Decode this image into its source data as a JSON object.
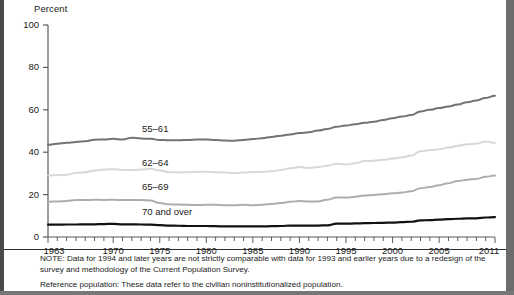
{
  "axis": {
    "y_title": "Percent",
    "y_ticks": [
      0,
      20,
      40,
      60,
      80,
      100
    ],
    "x_ticks_major": [
      1963,
      1970,
      1975,
      1980,
      1985,
      1990,
      1995,
      2000,
      2005,
      2011
    ],
    "x_min": 1963,
    "x_max": 2011
  },
  "series_labels": {
    "s55_61": "55–61",
    "s62_64": "62–64",
    "s65_69": "65–69",
    "s70_over": "70 and over"
  },
  "colors": {
    "s55_61": "#737373",
    "s62_64": "#d8d8d8",
    "s65_69": "#aeaeae",
    "s70_over": "#121212",
    "axis": "#5a5a5a",
    "text": "#1a1a1a"
  },
  "notes": {
    "line1": "NOTE: Data for 1994 and later years are not strictly comparable with data for 1993 and earlier years due to a redesign of the survey and methodology of the Current Population Survey.",
    "line2": "Reference population: These data refer to the civilian noninstitutionalized population."
  },
  "chart_data": {
    "type": "line",
    "title": "",
    "xlabel": "",
    "ylabel": "Percent",
    "xlim": [
      1963,
      2011
    ],
    "ylim": [
      0,
      100
    ],
    "grid": false,
    "legend": "inline-labels",
    "x": [
      1963,
      1964,
      1965,
      1966,
      1967,
      1968,
      1969,
      1970,
      1971,
      1972,
      1973,
      1974,
      1975,
      1976,
      1977,
      1978,
      1979,
      1980,
      1981,
      1982,
      1983,
      1984,
      1985,
      1986,
      1987,
      1988,
      1989,
      1990,
      1991,
      1992,
      1993,
      1994,
      1995,
      1996,
      1997,
      1998,
      1999,
      2000,
      2001,
      2002,
      2003,
      2004,
      2005,
      2006,
      2007,
      2008,
      2009,
      2010,
      2011
    ],
    "series": [
      {
        "name": "55–61",
        "color": "#737373",
        "values": [
          43.5,
          44.0,
          44.4,
          44.8,
          45.2,
          45.9,
          46.0,
          46.3,
          46.0,
          46.8,
          46.5,
          46.3,
          45.8,
          45.6,
          45.6,
          45.8,
          46.0,
          46.0,
          45.8,
          45.5,
          45.4,
          45.8,
          46.2,
          46.6,
          47.2,
          47.8,
          48.4,
          49.0,
          49.4,
          50.2,
          51.0,
          52.0,
          52.6,
          53.2,
          53.9,
          54.4,
          55.2,
          56.0,
          56.8,
          57.5,
          59.2,
          60.0,
          60.8,
          61.6,
          62.5,
          63.6,
          64.4,
          65.6,
          66.6
        ]
      },
      {
        "name": "62–64",
        "color": "#d8d8d8",
        "values": [
          29.0,
          29.2,
          29.4,
          30.2,
          30.6,
          31.4,
          31.8,
          32.0,
          31.6,
          31.6,
          31.8,
          32.2,
          31.4,
          30.6,
          30.5,
          30.6,
          30.8,
          30.8,
          30.6,
          30.4,
          30.2,
          30.4,
          30.6,
          30.8,
          31.0,
          31.6,
          32.4,
          33.0,
          32.6,
          33.0,
          33.6,
          34.6,
          34.2,
          34.8,
          35.8,
          36.0,
          36.4,
          37.0,
          37.6,
          38.4,
          40.4,
          41.0,
          41.4,
          42.2,
          43.0,
          43.8,
          44.0,
          45.0,
          44.4
        ]
      },
      {
        "name": "65–69",
        "color": "#aeaeae",
        "values": [
          16.6,
          16.8,
          17.0,
          17.4,
          17.4,
          17.6,
          17.5,
          17.6,
          17.4,
          17.4,
          17.4,
          17.2,
          16.0,
          15.4,
          15.3,
          15.2,
          15.1,
          15.2,
          15.2,
          15.0,
          15.0,
          15.2,
          15.0,
          15.2,
          15.6,
          16.0,
          16.6,
          17.0,
          16.8,
          16.8,
          17.6,
          18.6,
          18.6,
          19.0,
          19.6,
          19.8,
          20.2,
          20.6,
          21.0,
          21.6,
          23.0,
          23.6,
          24.4,
          25.4,
          26.4,
          27.0,
          27.4,
          28.4,
          29.0
        ]
      },
      {
        "name": "70 and over",
        "color": "#121212",
        "values": [
          5.8,
          5.8,
          5.9,
          5.9,
          6.0,
          6.0,
          6.1,
          6.2,
          6.0,
          6.0,
          5.9,
          5.8,
          5.6,
          5.4,
          5.3,
          5.2,
          5.2,
          5.2,
          5.1,
          5.0,
          5.0,
          5.0,
          5.0,
          5.0,
          5.1,
          5.2,
          5.4,
          5.4,
          5.4,
          5.4,
          5.5,
          6.3,
          6.3,
          6.4,
          6.5,
          6.6,
          6.7,
          6.8,
          7.0,
          7.2,
          7.8,
          8.0,
          8.2,
          8.4,
          8.6,
          8.8,
          8.8,
          9.2,
          9.4
        ]
      }
    ]
  },
  "series_label_positions": {
    "s55_61": {
      "x": 138,
      "y": 128
    },
    "s62_64": {
      "x": 138,
      "y": 162
    },
    "s65_69": {
      "x": 138,
      "y": 186
    },
    "s70_over": {
      "x": 138,
      "y": 212
    }
  }
}
